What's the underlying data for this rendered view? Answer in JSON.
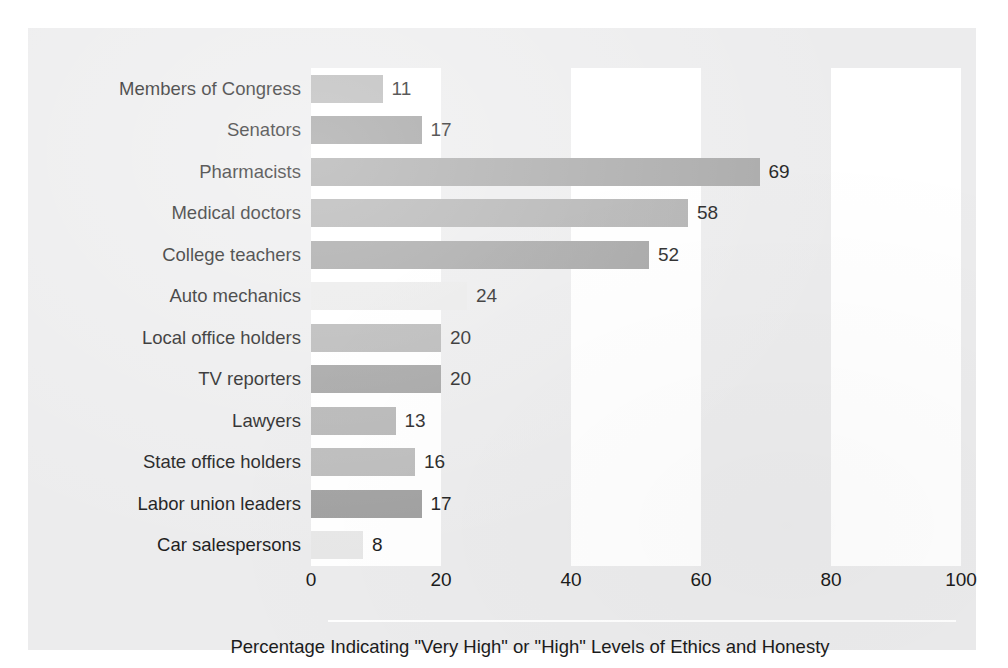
{
  "chart_data": {
    "type": "bar",
    "orientation": "horizontal",
    "title": "",
    "xlabel": "Percentage Indicating \"Very High\" or \"High\" Levels of Ethics and Honesty",
    "ylabel": "",
    "xlim": [
      0,
      100
    ],
    "xticks": [
      "0",
      "20",
      "40",
      "60",
      "80",
      "100"
    ],
    "xtick_values": [
      0,
      20,
      40,
      60,
      80,
      100
    ],
    "grid": false,
    "legend": null,
    "categories": [
      "Members of Congress",
      "Senators",
      "Pharmacists",
      "Medical doctors",
      "College teachers",
      "Auto mechanics",
      "Local office holders",
      "TV reporters",
      "Lawyers",
      "State office holders",
      "Labor union leaders",
      "Car salespersons"
    ],
    "values": [
      11,
      17,
      69,
      58,
      52,
      24,
      20,
      20,
      13,
      16,
      17,
      8
    ],
    "value_labels": [
      "11",
      "17",
      "69",
      "58",
      "52",
      "24",
      "20",
      "20",
      "13",
      "16",
      "17",
      "8"
    ],
    "bar_colors": [
      "#b7b7b7",
      "#9d9d9d",
      "#a8a8a8",
      "#b0b0b0",
      "#a2a2a2",
      "#eaeaea",
      "#b5b5b5",
      "#a0a0a0",
      "#b3b3b3",
      "#b9b9b9",
      "#9e9e9e",
      "#e7e7e7"
    ],
    "background_bands": [
      {
        "from": 0,
        "to": 20
      },
      {
        "from": 40,
        "to": 60
      },
      {
        "from": 80,
        "to": 100
      }
    ]
  },
  "colors": {
    "panel_background": "#ececed",
    "band_background": "#ffffff",
    "text": "#1b1b1b",
    "rule": "#ffffff"
  }
}
